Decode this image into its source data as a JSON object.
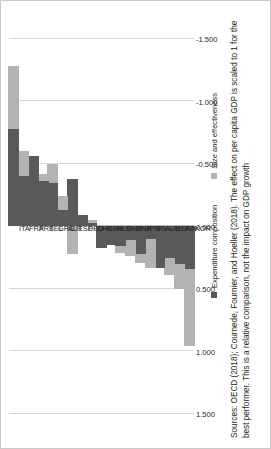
{
  "chart_data": {
    "type": "bar",
    "orientation": "horizontal-stacked",
    "title": "",
    "xlabel": "",
    "ylabel": "",
    "categories": [
      "KOR",
      "FIN",
      "USA",
      "AUS",
      "IRL",
      "JPN",
      "DNK",
      "SWE",
      "NLD",
      "GBR",
      "CHE",
      "DEU",
      "ESP",
      "AUT",
      "GRC",
      "BEL",
      "PRT",
      "FRA",
      "ITA"
    ],
    "series": [
      {
        "name": "Expenditure composition",
        "color": "#595959",
        "values": [
          0.34,
          0.3,
          0.25,
          0.33,
          0.1,
          0.22,
          0.11,
          0.16,
          0.15,
          0.17,
          -0.03,
          -0.09,
          -0.38,
          -0.13,
          -0.35,
          -0.36,
          -0.56,
          -0.4,
          -0.78
        ]
      },
      {
        "name": "Size and effectiveness",
        "color": "#b3b3b3",
        "values": [
          0.62,
          0.2,
          0.14,
          0.0,
          0.23,
          0.07,
          0.13,
          0.05,
          0.0,
          0.0,
          -0.02,
          0.0,
          0.22,
          -0.11,
          -0.15,
          -0.06,
          0.0,
          -0.2,
          -0.5
        ]
      }
    ],
    "xticks": [
      "1.500",
      "1.000",
      "0.500",
      "0.000",
      "-0.500",
      "-1.000",
      "-1.500"
    ],
    "xtick_values": [
      1.5,
      1.0,
      0.5,
      0.0,
      -0.5,
      -1.0,
      -1.5
    ],
    "xlim": [
      1.5,
      -1.5
    ],
    "grid": true,
    "legend_position": "bottom"
  },
  "legend": {
    "items": [
      {
        "label": "Expenditure composition",
        "color": "#595959"
      },
      {
        "label": "Size and effectiveness",
        "color": "#b3b3b3"
      }
    ]
  },
  "source": {
    "text": "Sources: OECD (2018); Cournede, Fournier, and Hoeller (2018). The effect on per capita GDP is scaled to 1 for the best performer. This is a relative comparison, not the impact on GDP growth"
  }
}
